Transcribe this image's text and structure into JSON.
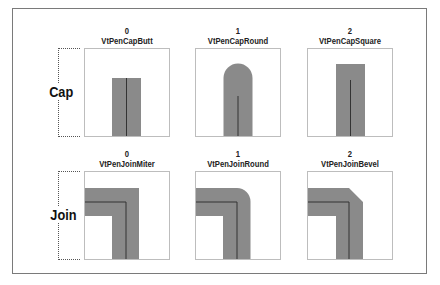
{
  "rows": [
    {
      "label": "Cap",
      "items": [
        {
          "index": "0",
          "name": "VtPenCapButt",
          "style": "butt"
        },
        {
          "index": "1",
          "name": "VtPenCapRound",
          "style": "round"
        },
        {
          "index": "2",
          "name": "VtPenCapSquare",
          "style": "square"
        }
      ]
    },
    {
      "label": "Join",
      "items": [
        {
          "index": "0",
          "name": "VtPenJoinMiter",
          "style": "miter"
        },
        {
          "index": "1",
          "name": "VtPenJoinRound",
          "style": "round"
        },
        {
          "index": "2",
          "name": "VtPenJoinBevel",
          "style": "bevel"
        }
      ]
    }
  ],
  "colors": {
    "stroke_fill": "#8a8a8a",
    "center_line": "#333333",
    "panel_border": "#bdbdbd",
    "frame_border": "#7a7a7a"
  }
}
